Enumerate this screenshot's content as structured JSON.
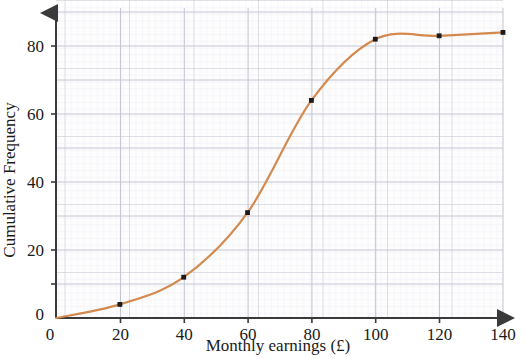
{
  "chart_data": {
    "type": "line",
    "title": "",
    "xlabel": "Monthly earnings (£)",
    "ylabel": "Cumulative Frequency",
    "xlim": [
      0,
      140
    ],
    "ylim": [
      0,
      90
    ],
    "xticks": [
      0,
      20,
      40,
      60,
      80,
      100,
      120,
      140
    ],
    "xtick_labels": [
      "0",
      "20",
      "40",
      "60",
      "80",
      "100",
      "120",
      "140"
    ],
    "yticks": [
      0,
      20,
      40,
      60,
      80
    ],
    "ytick_labels": [
      "0",
      "20",
      "40",
      "60",
      "80"
    ],
    "grid": true,
    "grid_minor": true,
    "legend": "none",
    "series": [
      {
        "name": "Cumulative frequency",
        "color": "#d4894e",
        "marker_color": "#1a1a1a",
        "x": [
          0,
          20,
          40,
          60,
          80,
          100,
          120,
          140
        ],
        "values": [
          0,
          4,
          12,
          31,
          64,
          82,
          83,
          84
        ]
      }
    ],
    "markers": [
      {
        "x": 20,
        "y": 4
      },
      {
        "x": 40,
        "y": 12
      },
      {
        "x": 60,
        "y": 31
      },
      {
        "x": 80,
        "y": 64
      },
      {
        "x": 100,
        "y": 82
      },
      {
        "x": 120,
        "y": 83
      },
      {
        "x": 140,
        "y": 84
      }
    ],
    "colors": {
      "curve": "#d4894e",
      "axis": "#3a3a3a",
      "grid_major": "#c9c9d4",
      "grid_minor": "#e6e6ee",
      "marker": "#1a1a1a",
      "text": "#1a1a1a",
      "background": "#ffffff"
    }
  },
  "axes": {
    "x_tick_labels": [
      "0",
      "20",
      "40",
      "60",
      "80",
      "100",
      "120",
      "140"
    ],
    "y_tick_labels": [
      "0",
      "20",
      "40",
      "60",
      "80"
    ],
    "x_title": "Monthly earnings (£)",
    "y_title": "Cumulative Frequency",
    "origin_label": "0"
  }
}
